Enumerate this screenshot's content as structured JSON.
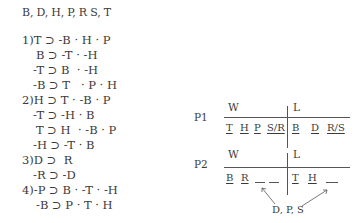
{
  "title": "B, D, H, P, R S, T",
  "rules": [
    {
      "num": "1)",
      "lines": [
        "T ⊃ -B · H · P",
        "B ⊃ -T · -H",
        "-T ⊃ B  · -H",
        "-B ⊃ T   · P · H"
      ]
    },
    {
      "num": "2)",
      "lines": [
        "H ⊃ T · -B · P",
        "-T ⊃ -H · B",
        "T ⊃ H  · -B · P",
        "-H ⊃ -T · B"
      ]
    },
    {
      "num": "3)",
      "lines": [
        "D ⊃  R",
        "-R ⊃ -D"
      ]
    },
    {
      "num": "4)",
      "lines": [
        "-P ⊃ B · -T · -H",
        "-B ⊃ P · T · H"
      ]
    }
  ],
  "p1": {
    "label": "P1",
    "w_header": "W",
    "l_header": "L",
    "w_slots": [
      "T",
      "H",
      "P",
      "S/R"
    ],
    "l_slots": [
      "B",
      "D",
      "R/S"
    ]
  },
  "p2": {
    "label": "P2",
    "w_header": "W",
    "l_header": "L",
    "w_slots": [
      "B",
      "R"
    ],
    "l_slots": [
      "T",
      "H"
    ],
    "note": "D, P, S"
  }
}
